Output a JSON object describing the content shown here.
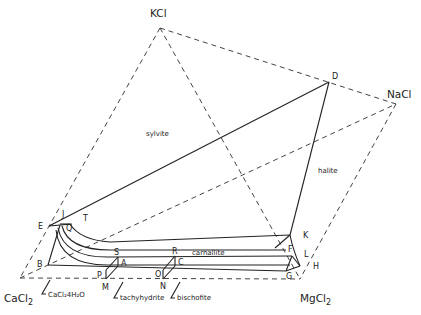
{
  "diagram": {
    "title": "",
    "components": {
      "kcl": "KCl",
      "nacl": "NaCl",
      "cacl2": "CaCl",
      "cacl2_sub": "2",
      "mgcl2": "MgCl",
      "mgcl2_sub": "2"
    },
    "phase_fields": {
      "sylvite": "sylvite",
      "halite": "halite",
      "carnallite": "carnallite"
    },
    "annotations": {
      "cacl2_4h2o": "CaCl₂4H₂O",
      "tachyhydrite": "tachyhydrite",
      "bischofite": "bischofite"
    },
    "points": {
      "D": "D",
      "E": "E",
      "J": "J",
      "T": "T",
      "Q": "Q",
      "B": "B",
      "S": "S",
      "A": "A",
      "P": "P",
      "M": "M",
      "R": "R",
      "C": "C",
      "O": "O",
      "N": "N",
      "K": "K",
      "F": "F",
      "L": "L",
      "G": "G",
      "H": "H"
    },
    "colors": {
      "line": "#222222",
      "background": "#ffffff"
    }
  }
}
